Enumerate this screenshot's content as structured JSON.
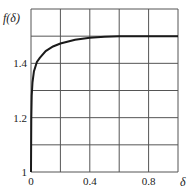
{
  "chart_data": {
    "type": "line",
    "title": "",
    "xlabel": "δ",
    "ylabel": "f(δ)",
    "xlim": [
      0,
      1.0
    ],
    "ylim": [
      1.0,
      1.6
    ],
    "grid": true,
    "x_ticks": [
      0,
      0.2,
      0.4,
      0.6,
      0.8,
      1.0
    ],
    "x_tick_labels": [
      {
        "value": 0,
        "label": "0"
      },
      {
        "value": 0.4,
        "label": "0.4"
      },
      {
        "value": 0.8,
        "label": "0.8"
      }
    ],
    "y_ticks": [
      1.0,
      1.1,
      1.2,
      1.3,
      1.4,
      1.5,
      1.6
    ],
    "y_tick_labels": [
      {
        "value": 1.0,
        "label": "1"
      },
      {
        "value": 1.2,
        "label": "1.2"
      },
      {
        "value": 1.4,
        "label": "1.4"
      }
    ],
    "series": [
      {
        "name": "f(δ)",
        "color": "#1a1a1a",
        "x": [
          0,
          0.002,
          0.005,
          0.01,
          0.02,
          0.04,
          0.06,
          0.1,
          0.15,
          0.2,
          0.3,
          0.4,
          0.5,
          0.6,
          0.7,
          0.8,
          0.9,
          1.0
        ],
        "y": [
          1.0,
          1.2,
          1.28,
          1.33,
          1.37,
          1.405,
          1.42,
          1.445,
          1.462,
          1.473,
          1.487,
          1.494,
          1.498,
          1.5,
          1.5,
          1.5,
          1.5,
          1.5
        ]
      }
    ]
  },
  "labels": {
    "ylabel": "f(δ)",
    "xlabel": "δ"
  }
}
